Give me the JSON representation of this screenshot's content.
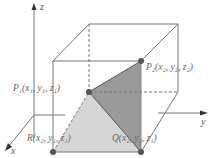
{
  "diagram": {
    "type": "3d-box-with-triangle",
    "axes": {
      "x_label": "x",
      "y_label": "y",
      "z_label": "z"
    },
    "points": {
      "P1": {
        "label": "P₁(x₁, y₁, z₁)"
      },
      "P2": {
        "label": "P₂(x₂, y₂, z₂)"
      },
      "Q": {
        "label": "Q(x₂, y₂, z₁)"
      },
      "R": {
        "label": "R(x₂, y₁, z₁)"
      }
    },
    "colors": {
      "line": "#777777",
      "point": "#555555",
      "face_dark": "#9a9a9a",
      "face_light": "#d6d6d6",
      "background": "#ffffff"
    }
  }
}
